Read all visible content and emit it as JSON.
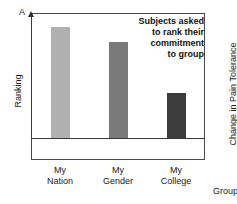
{
  "figure": {
    "panel_a_letter": "A",
    "panel_b_letter": "B"
  },
  "chart_data": {
    "type": "bar",
    "title": "",
    "categories": [
      "My Nation",
      "My Gender",
      "My College"
    ],
    "category_lines": [
      [
        "My",
        "Nation"
      ],
      [
        "My",
        "Gender"
      ],
      [
        "My",
        "College"
      ]
    ],
    "values": [
      111,
      96,
      45
    ],
    "value_units": "pixels above baseline (unlabeled ordinal axis)",
    "series": [
      {
        "name": "Ranking",
        "values": [
          111,
          96,
          45
        ],
        "colors": [
          "#b0b0b0",
          "#7a7a7a",
          "#3c3c3c"
        ]
      }
    ],
    "bar_colors": [
      "#b0b0b0",
      "#7a7a7a",
      "#3c3c3c"
    ],
    "xlabel": "",
    "ylabel": "Ranking",
    "ylim": [
      0,
      125
    ],
    "grid": false,
    "legend": false,
    "axis_ticks": false,
    "annotations": [
      "Subjects asked",
      "to rank their",
      "commitment",
      "to group"
    ]
  },
  "panel_a": {
    "ylabel": "Ranking",
    "annotation_lines": [
      "Subjects asked",
      "to rank their",
      "commitment",
      "to group"
    ]
  },
  "panel_b": {
    "ylabel": "Change in Pain Tolerance",
    "xlabel": "Group"
  }
}
